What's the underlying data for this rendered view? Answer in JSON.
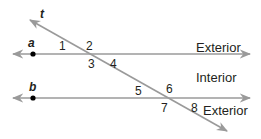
{
  "diagram": {
    "type": "parallel-lines-transversal",
    "colors": {
      "line": "#9a9a9a",
      "text": "#231f20",
      "point": "#000000"
    },
    "lines": {
      "a": {
        "label": "a"
      },
      "b": {
        "label": "b"
      },
      "t": {
        "label": "t"
      }
    },
    "angles": [
      "1",
      "2",
      "3",
      "4",
      "5",
      "6",
      "7",
      "8"
    ],
    "regions": {
      "exterior_top": "Exterior",
      "interior": "Interior",
      "exterior_bottom": "Exterior"
    }
  }
}
